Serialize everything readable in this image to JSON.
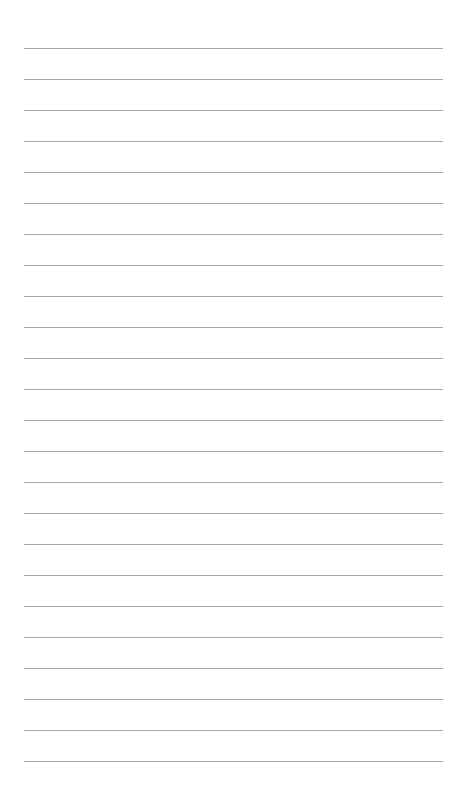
{
  "page": {
    "background": "#ffffff",
    "type": "lined-paper"
  },
  "rules": {
    "count": 24,
    "first_y": 48,
    "spacing": 31,
    "left_x": 24,
    "right_x": 443,
    "color": "#a6a6a6",
    "thickness": 1
  }
}
